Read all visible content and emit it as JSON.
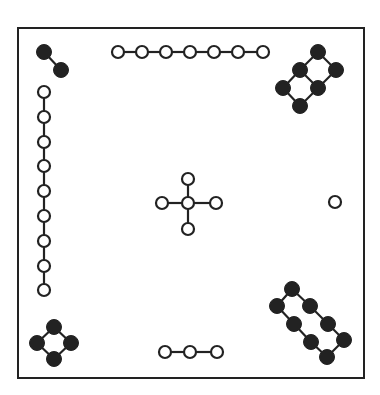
{
  "diagram": {
    "title": "",
    "colors": {
      "ink": "#222222",
      "background": "#ffffff",
      "hollow_fill": "#ffffff"
    },
    "frame": {
      "x": 18,
      "y": 28,
      "width": 346,
      "height": 350
    },
    "node_radius": 6,
    "filled_node_radius": 7.5,
    "groups": [
      {
        "name": "top-left-filled-pair",
        "style": "filled",
        "nodes": [
          [
            44,
            52
          ],
          [
            61,
            70
          ]
        ],
        "edges": [
          [
            0,
            1
          ]
        ]
      },
      {
        "name": "top-horizontal-chain",
        "style": "hollow",
        "nodes": [
          [
            118,
            52
          ],
          [
            142,
            52
          ],
          [
            166,
            52
          ],
          [
            190,
            52
          ],
          [
            214,
            52
          ],
          [
            238,
            52
          ],
          [
            263,
            52
          ]
        ],
        "edges": [
          [
            0,
            1
          ],
          [
            1,
            2
          ],
          [
            2,
            3
          ],
          [
            3,
            4
          ],
          [
            4,
            5
          ],
          [
            5,
            6
          ]
        ]
      },
      {
        "name": "top-right-filled-ring",
        "style": "filled",
        "nodes": [
          [
            318,
            52
          ],
          [
            300,
            70
          ],
          [
            336,
            70
          ],
          [
            283,
            88
          ],
          [
            318,
            88
          ],
          [
            300,
            106
          ]
        ],
        "edges": [
          [
            0,
            1
          ],
          [
            0,
            2
          ],
          [
            1,
            3
          ],
          [
            2,
            4
          ],
          [
            3,
            5
          ],
          [
            4,
            5
          ],
          [
            1,
            4
          ]
        ]
      },
      {
        "name": "left-vertical-chain",
        "style": "hollow",
        "nodes": [
          [
            44,
            92
          ],
          [
            44,
            117
          ],
          [
            44,
            142
          ],
          [
            44,
            166
          ],
          [
            44,
            191
          ],
          [
            44,
            216
          ],
          [
            44,
            241
          ],
          [
            44,
            266
          ],
          [
            44,
            290
          ]
        ],
        "edges": [
          [
            0,
            1
          ],
          [
            1,
            2
          ],
          [
            2,
            3
          ],
          [
            3,
            4
          ],
          [
            4,
            5
          ],
          [
            5,
            6
          ],
          [
            6,
            7
          ],
          [
            7,
            8
          ]
        ]
      },
      {
        "name": "center-cross",
        "style": "hollow",
        "nodes": [
          [
            188,
            203
          ],
          [
            188,
            179
          ],
          [
            162,
            203
          ],
          [
            216,
            203
          ],
          [
            188,
            229
          ]
        ],
        "edges": [
          [
            0,
            1
          ],
          [
            0,
            2
          ],
          [
            0,
            3
          ],
          [
            0,
            4
          ]
        ]
      },
      {
        "name": "right-single-node",
        "style": "hollow",
        "nodes": [
          [
            335,
            202
          ]
        ],
        "edges": []
      },
      {
        "name": "bottom-right-filled-ladder",
        "style": "filled",
        "nodes": [
          [
            292,
            289
          ],
          [
            277,
            306
          ],
          [
            310,
            306
          ],
          [
            294,
            324
          ],
          [
            328,
            324
          ],
          [
            311,
            342
          ],
          [
            344,
            340
          ],
          [
            327,
            357
          ]
        ],
        "edges": [
          [
            0,
            1
          ],
          [
            0,
            2
          ],
          [
            1,
            3
          ],
          [
            2,
            4
          ],
          [
            3,
            5
          ],
          [
            4,
            6
          ],
          [
            5,
            7
          ],
          [
            6,
            7
          ]
        ]
      },
      {
        "name": "bottom-left-filled-diamond",
        "style": "filled",
        "nodes": [
          [
            54,
            327
          ],
          [
            37,
            343
          ],
          [
            71,
            343
          ],
          [
            54,
            359
          ]
        ],
        "edges": [
          [
            0,
            1
          ],
          [
            0,
            2
          ],
          [
            1,
            3
          ],
          [
            2,
            3
          ]
        ]
      },
      {
        "name": "bottom-horizontal-chain",
        "style": "hollow",
        "nodes": [
          [
            165,
            352
          ],
          [
            190,
            352
          ],
          [
            217,
            352
          ]
        ],
        "edges": [
          [
            0,
            1
          ],
          [
            1,
            2
          ]
        ]
      }
    ]
  }
}
